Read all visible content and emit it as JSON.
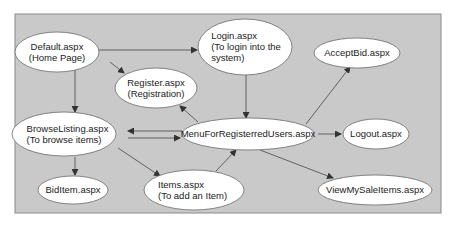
{
  "diagram": {
    "type": "page-navigation-flow",
    "colors": {
      "background": "#ffffff",
      "panel": "#c9c9c9",
      "panel_border": "#8a8a8a",
      "node_fill": "#ffffff",
      "node_stroke": "#6a6a6a",
      "edge": "#555555",
      "text": "#222222"
    },
    "nodes": [
      {
        "id": "default",
        "lines": [
          "Default.aspx",
          "(Home Page)"
        ],
        "cx": 57,
        "cy": 52,
        "rx": 42,
        "ry": 20,
        "align": "middle"
      },
      {
        "id": "login",
        "lines": [
          "Login.aspx",
          "(To login into the",
          "system)"
        ],
        "cx": 245,
        "cy": 47,
        "rx": 47,
        "ry": 28,
        "align": "start"
      },
      {
        "id": "acceptbid",
        "lines": [
          "AcceptBid.aspx"
        ],
        "cx": 357,
        "cy": 53,
        "rx": 43,
        "ry": 15,
        "align": "middle"
      },
      {
        "id": "register",
        "lines": [
          "Register.aspx",
          "(Registration)"
        ],
        "cx": 156,
        "cy": 88,
        "rx": 41,
        "ry": 20,
        "align": "middle"
      },
      {
        "id": "browse",
        "lines": [
          "BrowseListing.aspx",
          "(To browse items)"
        ],
        "cx": 64,
        "cy": 134,
        "rx": 52,
        "ry": 22,
        "align": "start"
      },
      {
        "id": "menu",
        "lines": [
          "MenuForRegisterredUsers.aspx"
        ],
        "cx": 248,
        "cy": 134,
        "rx": 66,
        "ry": 16,
        "align": "middle"
      },
      {
        "id": "logout",
        "lines": [
          "Logout.aspx"
        ],
        "cx": 376,
        "cy": 134,
        "rx": 33,
        "ry": 15,
        "align": "middle"
      },
      {
        "id": "biditem",
        "lines": [
          "BidItem.aspx"
        ],
        "cx": 73,
        "cy": 190,
        "rx": 35,
        "ry": 14,
        "align": "middle"
      },
      {
        "id": "items",
        "lines": [
          "Items.aspx",
          "(To add an Item)"
        ],
        "cx": 194,
        "cy": 190,
        "rx": 50,
        "ry": 20,
        "align": "start"
      },
      {
        "id": "viewsale",
        "lines": [
          "ViewMySaleItems.aspx"
        ],
        "cx": 375,
        "cy": 190,
        "rx": 57,
        "ry": 15,
        "align": "middle"
      }
    ],
    "edges": [
      {
        "from": "default",
        "to": "login",
        "x1": 99,
        "y1": 50,
        "x2": 197,
        "y2": 50
      },
      {
        "from": "default",
        "to": "register",
        "x1": 110,
        "y1": 62,
        "x2": 124,
        "y2": 73
      },
      {
        "from": "default",
        "to": "browse",
        "x1": 75,
        "y1": 70,
        "x2": 75,
        "y2": 112
      },
      {
        "from": "login",
        "to": "menu",
        "x1": 246,
        "y1": 75,
        "x2": 246,
        "y2": 118
      },
      {
        "from": "menu",
        "to": "register",
        "x1": 198,
        "y1": 122,
        "x2": 180,
        "y2": 106
      },
      {
        "from": "menu",
        "to": "acceptbid",
        "x1": 306,
        "y1": 124,
        "x2": 350,
        "y2": 67
      },
      {
        "from": "menu",
        "to": "logout",
        "x1": 318,
        "y1": 134,
        "x2": 341,
        "y2": 134
      },
      {
        "from": "menu",
        "to": "browse",
        "x1": 182,
        "y1": 131,
        "x2": 128,
        "y2": 131
      },
      {
        "from": "browse",
        "to": "menu",
        "x1": 128,
        "y1": 138,
        "x2": 180,
        "y2": 138
      },
      {
        "from": "browse",
        "to": "biditem",
        "x1": 75,
        "y1": 157,
        "x2": 75,
        "y2": 175
      },
      {
        "from": "browse",
        "to": "items",
        "x1": 118,
        "y1": 148,
        "x2": 160,
        "y2": 176
      },
      {
        "from": "items",
        "to": "menu",
        "x1": 216,
        "y1": 171,
        "x2": 236,
        "y2": 150
      },
      {
        "from": "menu",
        "to": "viewsale",
        "x1": 260,
        "y1": 150,
        "x2": 333,
        "y2": 178
      }
    ]
  }
}
